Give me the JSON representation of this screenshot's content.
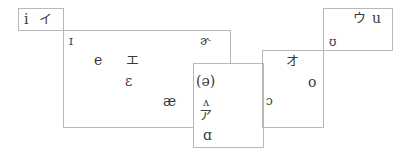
{
  "diagram": {
    "type": "vowel-chart",
    "boxes": [
      {
        "id": "i",
        "label_ipa": "i",
        "label_kana": "イ"
      },
      {
        "id": "e",
        "label_kana": "エ"
      },
      {
        "id": "a",
        "label_kana": "ア"
      },
      {
        "id": "o",
        "label_kana": "オ"
      },
      {
        "id": "u",
        "label_kana": "ウ",
        "label_ipa": "u"
      }
    ],
    "symbols": {
      "i_ipa": "i",
      "i_kana": "イ",
      "near_close_front": "ɪ",
      "e": "e",
      "e_kana": "エ",
      "open_mid_front": "ɛ",
      "ash": "æ",
      "rhotic_schwa": "ɚ",
      "schwa": "(ə)",
      "wedge": "ʌ",
      "a_kana": "ア",
      "open_back": "ɑ",
      "open_mid_back": "ɔ",
      "o_kana": "オ",
      "o": "o",
      "near_close_back": "ʊ",
      "u_kana": "ウ",
      "u_ipa": "u"
    },
    "line_color": "#b8b8b8"
  }
}
